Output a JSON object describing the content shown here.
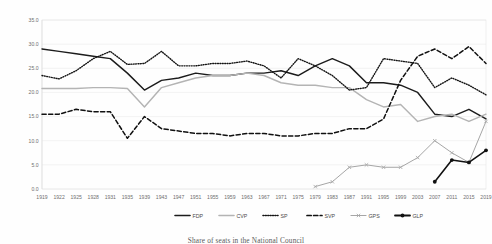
{
  "chart_data": {
    "type": "line",
    "title": "",
    "caption": "Share of seats in the National Council",
    "xlabel": "",
    "ylabel": "",
    "ylim": [
      0,
      35
    ],
    "yticks": [
      0.0,
      5.0,
      10.0,
      15.0,
      20.0,
      25.0,
      30.0,
      35.0
    ],
    "ytick_labels": [
      "0.0",
      "5.0",
      "10.0",
      "15.0",
      "20.0",
      "25.0",
      "30.0",
      "35.0"
    ],
    "grid": true,
    "legend_position": "bottom",
    "x": [
      1919,
      1922,
      1925,
      1928,
      1931,
      1935,
      1939,
      1943,
      1947,
      1951,
      1955,
      1959,
      1963,
      1967,
      1971,
      1975,
      1979,
      1983,
      1987,
      1991,
      1995,
      1999,
      2003,
      2007,
      2011,
      2015,
      2019
    ],
    "categories": [
      "1919",
      "1922",
      "1925",
      "1928",
      "1931",
      "1935",
      "1939",
      "1943",
      "1947",
      "1951",
      "1955",
      "1959",
      "1963",
      "1967",
      "1971",
      "1975",
      "1979",
      "1983",
      "1987",
      "1991",
      "1995",
      "1999",
      "2003",
      "2007",
      "2011",
      "2015",
      "2019"
    ],
    "series": [
      {
        "name": "FDP",
        "style": "solid",
        "color": "#1c1c1c",
        "width": 1.45,
        "marker": "none",
        "values": [
          29.0,
          28.5,
          28.0,
          27.5,
          27.0,
          24.0,
          20.5,
          22.5,
          23.0,
          24.0,
          23.5,
          23.5,
          24.0,
          24.0,
          24.5,
          23.5,
          25.5,
          27.0,
          25.5,
          22.0,
          22.0,
          21.5,
          20.0,
          15.5,
          15.0,
          16.5,
          14.5
        ]
      },
      {
        "name": "CVP",
        "style": "solid",
        "color": "#b4b4b4",
        "width": 1.45,
        "marker": "none",
        "values": [
          20.8,
          20.8,
          20.8,
          21.0,
          21.0,
          20.8,
          17.0,
          21.0,
          22.0,
          23.0,
          23.5,
          23.5,
          24.0,
          23.5,
          22.0,
          21.5,
          21.5,
          21.0,
          21.0,
          18.5,
          17.0,
          17.5,
          14.0,
          15.0,
          15.5,
          14.0,
          15.5
        ]
      },
      {
        "name": "SP",
        "style": "dotted",
        "color": "#141414",
        "width": 1.4,
        "marker": "none",
        "values": [
          23.5,
          22.8,
          24.5,
          27.0,
          28.5,
          25.8,
          26.0,
          28.5,
          25.5,
          25.5,
          26.0,
          26.0,
          26.5,
          25.5,
          23.0,
          27.0,
          25.5,
          23.5,
          20.5,
          21.0,
          27.0,
          26.5,
          26.0,
          21.0,
          23.0,
          21.5,
          19.5
        ]
      },
      {
        "name": "SVP",
        "style": "dashed",
        "color": "#101010",
        "width": 1.5,
        "marker": "none",
        "values": [
          15.5,
          15.5,
          16.5,
          16.0,
          16.0,
          10.5,
          15.0,
          12.5,
          12.0,
          11.5,
          11.5,
          11.0,
          11.5,
          11.5,
          11.0,
          11.0,
          11.5,
          11.5,
          12.5,
          12.5,
          14.5,
          22.5,
          27.5,
          29.0,
          27.0,
          29.5,
          26.0
        ]
      },
      {
        "name": "GPS",
        "style": "solid-marker",
        "color": "#a6a6a6",
        "width": 1.0,
        "marker": "cross",
        "values": [
          null,
          null,
          null,
          null,
          null,
          null,
          null,
          null,
          null,
          null,
          null,
          null,
          null,
          null,
          null,
          null,
          0.5,
          1.5,
          4.5,
          5.0,
          4.5,
          4.5,
          6.5,
          10.0,
          7.5,
          5.5,
          14.0
        ]
      },
      {
        "name": "GLP",
        "style": "solid-marker",
        "color": "#111111",
        "width": 1.6,
        "marker": "dot",
        "values": [
          null,
          null,
          null,
          null,
          null,
          null,
          null,
          null,
          null,
          null,
          null,
          null,
          null,
          null,
          null,
          null,
          null,
          null,
          null,
          null,
          null,
          null,
          null,
          1.5,
          6.0,
          5.5,
          8.0
        ]
      }
    ]
  },
  "legend": {
    "items": [
      {
        "label": "FDP"
      },
      {
        "label": "CVP"
      },
      {
        "label": "SP"
      },
      {
        "label": "SVP"
      },
      {
        "label": "GPS"
      },
      {
        "label": "GLP"
      }
    ]
  }
}
